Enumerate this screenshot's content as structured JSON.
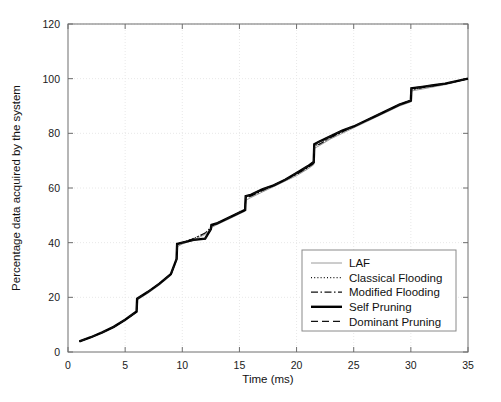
{
  "chart_data": {
    "type": "line",
    "title": "",
    "xlabel": "Time (ms)",
    "ylabel": "Percentage data acquired by the system",
    "xlim": [
      0,
      35
    ],
    "ylim": [
      0,
      120
    ],
    "xticks": [
      0,
      5,
      10,
      15,
      20,
      25,
      30,
      35
    ],
    "yticks": [
      0,
      20,
      40,
      60,
      80,
      100,
      120
    ],
    "xtick_labels": [
      "0",
      "5",
      "10",
      "15",
      "20",
      "25",
      "30",
      "35"
    ],
    "ytick_labels": [
      "0",
      "20",
      "40",
      "60",
      "80",
      "100",
      "120"
    ],
    "grid": true,
    "grid_style": "dotted",
    "legend_position": "lower right",
    "series": [
      {
        "name": "LAF",
        "style": "solid-thin",
        "color": "#808080",
        "width": 0.8,
        "x": [
          1,
          2,
          3,
          4,
          5,
          6,
          6.05,
          7,
          8,
          9,
          9.5,
          9.55,
          10,
          11,
          12,
          12.5,
          12.55,
          13,
          14,
          15,
          15.5,
          15.55,
          16,
          17,
          18,
          19,
          20,
          21,
          21.5,
          21.55,
          22,
          23,
          24,
          25,
          26,
          27,
          28,
          29,
          30,
          30.05,
          31,
          32,
          33,
          34,
          35
        ],
        "y": [
          3.8,
          5.2,
          7.0,
          9.0,
          11.5,
          14.5,
          19.0,
          21.5,
          24.5,
          28.0,
          33.5,
          38.5,
          39.5,
          41.0,
          43.0,
          45.0,
          45.5,
          46.5,
          48.5,
          50.5,
          51.5,
          55.5,
          56.5,
          58.5,
          60.5,
          62.5,
          64.5,
          67.0,
          68.5,
          74.5,
          75.5,
          78.0,
          80.0,
          82.0,
          84.0,
          86.0,
          88.0,
          90.0,
          91.5,
          95.5,
          96.2,
          97.0,
          97.8,
          98.8,
          100.0
        ]
      },
      {
        "name": "Classical Flooding",
        "style": "dotted",
        "color": "#111111",
        "width": 1.1,
        "x": [
          1,
          2,
          3,
          4,
          5,
          6,
          6.05,
          7,
          8,
          9,
          9.5,
          9.55,
          10,
          11,
          12,
          12.5,
          12.55,
          13,
          14,
          15,
          15.5,
          15.55,
          16,
          17,
          18,
          19,
          20,
          21,
          21.5,
          21.55,
          22,
          23,
          24,
          25,
          26,
          27,
          28,
          29,
          30,
          30.05,
          31,
          32,
          33,
          34,
          35
        ],
        "y": [
          3.9,
          5.4,
          7.2,
          9.2,
          11.8,
          14.8,
          19.5,
          22.0,
          25.0,
          28.5,
          34.0,
          39.5,
          40.0,
          41.5,
          43.5,
          45.5,
          46.0,
          47.0,
          49.0,
          51.0,
          52.0,
          56.5,
          57.0,
          59.0,
          61.0,
          63.0,
          65.0,
          67.5,
          69.0,
          75.5,
          76.0,
          78.5,
          80.5,
          82.5,
          84.5,
          86.5,
          88.5,
          90.5,
          92.0,
          96.0,
          96.7,
          97.4,
          98.1,
          99.0,
          100.0
        ]
      },
      {
        "name": "Modified Flooding",
        "style": "dashdot",
        "color": "#111111",
        "width": 1.2,
        "x": [
          1,
          2,
          3,
          4,
          5,
          6,
          6.05,
          7,
          8,
          9,
          9.5,
          9.55,
          10,
          11,
          12,
          12.5,
          12.55,
          13,
          14,
          15,
          15.5,
          15.55,
          16,
          17,
          18,
          19,
          20,
          21,
          21.5,
          21.55,
          22,
          23,
          24,
          25,
          26,
          27,
          28,
          29,
          30,
          30.05,
          31,
          32,
          33,
          34,
          35
        ],
        "y": [
          3.9,
          5.4,
          7.2,
          9.2,
          11.8,
          14.8,
          19.5,
          22.0,
          25.0,
          28.5,
          34.0,
          39.5,
          40.0,
          41.5,
          43.5,
          45.5,
          46.0,
          47.0,
          49.0,
          51.0,
          52.0,
          56.5,
          57.0,
          59.0,
          61.0,
          63.0,
          65.0,
          67.5,
          69.0,
          75.5,
          76.0,
          78.5,
          80.5,
          82.5,
          84.5,
          86.5,
          88.5,
          90.5,
          92.0,
          96.0,
          96.7,
          97.4,
          98.1,
          99.0,
          100.0
        ]
      },
      {
        "name": "Self Pruning",
        "style": "solid-thick",
        "color": "#000000",
        "width": 2.4,
        "x": [
          1,
          2,
          3,
          4,
          5,
          6,
          6.05,
          7,
          8,
          9,
          9.5,
          9.55,
          10,
          11,
          12,
          12.5,
          12.55,
          13,
          14,
          15,
          15.5,
          15.55,
          16,
          17,
          18,
          19,
          20,
          21,
          21.5,
          21.55,
          22,
          23,
          24,
          25,
          26,
          27,
          28,
          29,
          30,
          30.05,
          31,
          32,
          33,
          34,
          35
        ],
        "y": [
          3.9,
          5.4,
          7.2,
          9.2,
          11.8,
          14.8,
          19.5,
          22.0,
          25.0,
          28.5,
          34.0,
          39.5,
          40.0,
          41.0,
          41.5,
          45.0,
          46.5,
          47.0,
          49.0,
          51.0,
          52.0,
          57.0,
          57.5,
          59.5,
          61.0,
          63.0,
          65.5,
          68.0,
          69.5,
          76.0,
          77.0,
          79.0,
          81.0,
          82.5,
          84.5,
          86.5,
          88.5,
          90.5,
          92.0,
          96.5,
          97.0,
          97.6,
          98.2,
          99.1,
          100.0
        ]
      },
      {
        "name": "Dominant Pruning",
        "style": "dashed",
        "color": "#111111",
        "width": 1.3,
        "x": [
          1,
          2,
          3,
          4,
          5,
          6,
          6.05,
          7,
          8,
          9,
          9.5,
          9.55,
          10,
          11,
          12,
          12.5,
          12.55,
          13,
          14,
          15,
          15.5,
          15.55,
          16,
          17,
          18,
          19,
          20,
          21,
          21.5,
          21.55,
          22,
          23,
          24,
          25,
          26,
          27,
          28,
          29,
          30,
          30.05,
          31,
          32,
          33,
          34,
          35
        ],
        "y": [
          3.9,
          5.4,
          7.2,
          9.2,
          11.8,
          14.8,
          19.5,
          22.0,
          25.0,
          28.5,
          34.0,
          39.5,
          40.0,
          41.0,
          41.5,
          45.0,
          46.5,
          47.0,
          49.0,
          51.0,
          52.0,
          57.0,
          57.5,
          59.5,
          61.0,
          63.0,
          65.5,
          68.0,
          69.5,
          76.0,
          77.0,
          79.0,
          81.0,
          82.5,
          84.5,
          86.5,
          88.5,
          90.5,
          92.0,
          96.5,
          97.0,
          97.6,
          98.2,
          99.1,
          100.0
        ]
      }
    ]
  },
  "legend": {
    "entries": [
      {
        "label": "LAF",
        "style": "solid-thin"
      },
      {
        "label": "Classical Flooding",
        "style": "dotted"
      },
      {
        "label": "Modified Flooding",
        "style": "dashdot"
      },
      {
        "label": "Self Pruning",
        "style": "solid-thick"
      },
      {
        "label": "Dominant Pruning",
        "style": "dashed"
      }
    ]
  },
  "colors": {
    "axis": "#6e6e6e",
    "grid": "#e8e8e8",
    "curve": "#000000",
    "background": "#ffffff"
  }
}
